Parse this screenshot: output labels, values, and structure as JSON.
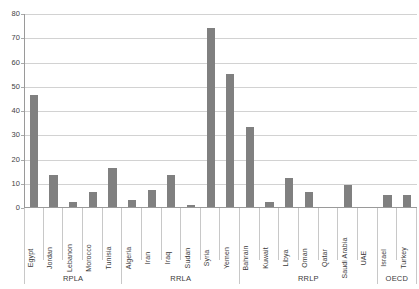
{
  "chart_data": {
    "type": "bar",
    "title": "",
    "subtitle": "",
    "xlabel": "",
    "ylabel": "",
    "ylim": [
      0,
      80
    ],
    "ytick_step": 10,
    "yticks": [
      0,
      10,
      20,
      30,
      40,
      50,
      60,
      70,
      80
    ],
    "ytick_labels": [
      "0",
      "10",
      "20",
      "30",
      "40",
      "50",
      "60",
      "70",
      "80"
    ],
    "grid": true,
    "grid_axis": "y",
    "legend": false,
    "legend_position": "none",
    "bar_color": "#808080",
    "gridline_color": "#d2d2d2",
    "axis_color": "#9a9a9a",
    "categories": [
      "Egypt",
      "Jordan",
      "Lebanon",
      "Morocco",
      "Tunisia",
      "Algeria",
      "Iran",
      "Iraq",
      "Sudan",
      "Syria",
      "Yemen",
      "Bahrain",
      "Kuwait",
      "Libya",
      "Oman",
      "Qatar",
      "Saudi Arabia",
      "UAE",
      "Israel",
      "Turkey"
    ],
    "values": [
      46,
      13,
      2,
      6,
      16,
      3,
      7,
      13,
      1,
      74,
      55,
      33,
      2,
      12,
      6,
      0,
      9,
      0,
      5,
      5
    ],
    "groups": [
      {
        "label": "RPLA",
        "start": 0,
        "end": 4
      },
      {
        "label": "RRLA",
        "start": 5,
        "end": 10
      },
      {
        "label": "RRLP",
        "start": 11,
        "end": 17
      },
      {
        "label": "OECD",
        "start": 18,
        "end": 19
      }
    ]
  }
}
